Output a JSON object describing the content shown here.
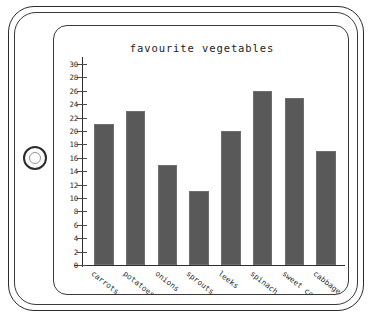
{
  "device": {
    "type": "tablet-illustration",
    "home_button": "home-button"
  },
  "chart_data": {
    "type": "bar",
    "title": "favourite vegetables",
    "xlabel": "",
    "ylabel": "",
    "categories": [
      "carrots",
      "potatoes",
      "onions",
      "sprouts",
      "leeks",
      "spinach",
      "sweet corn",
      "cabbage"
    ],
    "values": [
      21,
      23,
      15,
      11,
      20,
      26,
      25,
      17
    ],
    "ylim": [
      0,
      30
    ],
    "ytick_step": 2,
    "yticks": [
      0,
      2,
      4,
      6,
      8,
      10,
      12,
      14,
      16,
      18,
      20,
      22,
      24,
      26,
      28,
      30
    ],
    "grid": false,
    "legend": null,
    "bar_color": "#595959",
    "axis_color": "#2e2e2e"
  }
}
